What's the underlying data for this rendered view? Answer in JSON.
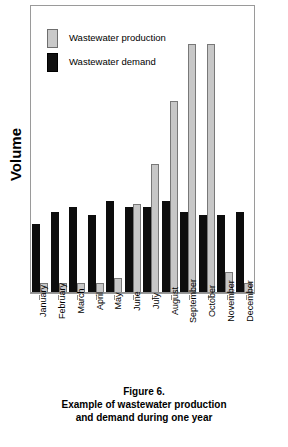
{
  "figure": {
    "y_axis_title": "Volume",
    "caption_lines": [
      "Figure 6.",
      "Example of wastewater production",
      "and demand during one year"
    ],
    "caption_label": "Figure 6.",
    "caption_line2": "Example of wastewater production",
    "caption_line3": "and demand during one year"
  },
  "legend": {
    "position": "top-left",
    "entries": [
      {
        "label": "Wastewater production",
        "color": "#c7c7c7",
        "icon": "square-swatch-icon"
      },
      {
        "label": "Wastewater demand",
        "color": "#0d0d0d",
        "icon": "square-swatch-icon"
      }
    ]
  },
  "colors": {
    "production": "#c7c7c7",
    "production_border": "#787878",
    "demand": "#0d0d0d",
    "frame": "#9a9a9a",
    "background": "#ffffff"
  },
  "chart_data": {
    "type": "bar",
    "title": "Example of wastewater production and demand during one year",
    "xlabel": "",
    "ylabel": "Volume",
    "grid": false,
    "legend_position": "top-left",
    "ylim": [
      0,
      100
    ],
    "y_ticks_shown": false,
    "categories": [
      "January",
      "February",
      "March",
      "April",
      "May",
      "June",
      "July",
      "August",
      "September",
      "October",
      "November",
      "December"
    ],
    "series": [
      {
        "name": "Wastewater demand",
        "color": "#0d0d0d",
        "values": [
          24,
          28,
          30,
          27,
          32,
          30,
          30,
          32,
          28,
          27,
          27,
          28
        ]
      },
      {
        "name": "Wastewater production",
        "color": "#c7c7c7",
        "values": [
          3,
          3,
          3,
          3,
          5,
          31,
          45,
          67,
          87,
          87,
          7,
          3
        ]
      }
    ]
  }
}
